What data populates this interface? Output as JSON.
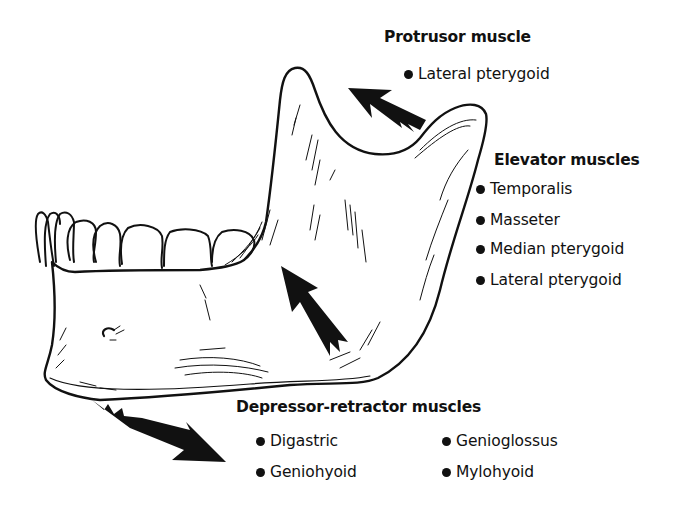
{
  "diagram": {
    "groups": [
      {
        "id": "protrusor",
        "heading": "Protrusor muscle",
        "items": [
          "Lateral pterygoid"
        ]
      },
      {
        "id": "elevator",
        "heading": "Elevator muscles",
        "items": [
          "Temporalis",
          "Masseter",
          "Median pterygoid",
          "Lateral pterygoid"
        ]
      },
      {
        "id": "depressor-retractor",
        "heading": "Depressor-retractor muscles",
        "items": [
          "Digastric",
          "Geniohyoid",
          "Genioglossus",
          "Mylohyoid"
        ]
      }
    ],
    "arrows": [
      {
        "name": "protrusor-arrow",
        "direction": "up-left",
        "location": "mandibular notch"
      },
      {
        "name": "elevator-arrow",
        "direction": "up-left",
        "location": "ramus"
      },
      {
        "name": "depressor-arrow",
        "direction": "down-right",
        "location": "below chin"
      }
    ],
    "colors": {
      "ink": "#111111",
      "background": "#ffffff"
    }
  }
}
